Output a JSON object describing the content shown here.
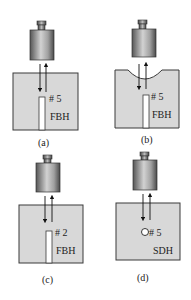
{
  "colors": {
    "block_fill": "#d8d8d8",
    "block_stroke": "#3a3a3a",
    "hole_fill": "#ffffff",
    "arrow": "#111111",
    "transducer_dark": "#6a6a6a",
    "transducer_light": "#c8c8c8"
  },
  "panels": [
    {
      "id": "a",
      "caption": "(a)",
      "hole_number": "# 5",
      "hole_type": "FBH",
      "surface": "flat",
      "reflector": "flat-bottom-hole"
    },
    {
      "id": "b",
      "caption": "(b)",
      "hole_number": "# 5",
      "hole_type": "FBH",
      "surface": "concave",
      "reflector": "flat-bottom-hole"
    },
    {
      "id": "c",
      "caption": "(c)",
      "hole_number": "# 2",
      "hole_type": "FBH",
      "surface": "flat",
      "reflector": "flat-bottom-hole"
    },
    {
      "id": "d",
      "caption": "(d)",
      "hole_number": "# 5",
      "hole_type": "SDH",
      "surface": "flat",
      "reflector": "side-drilled-hole"
    }
  ]
}
